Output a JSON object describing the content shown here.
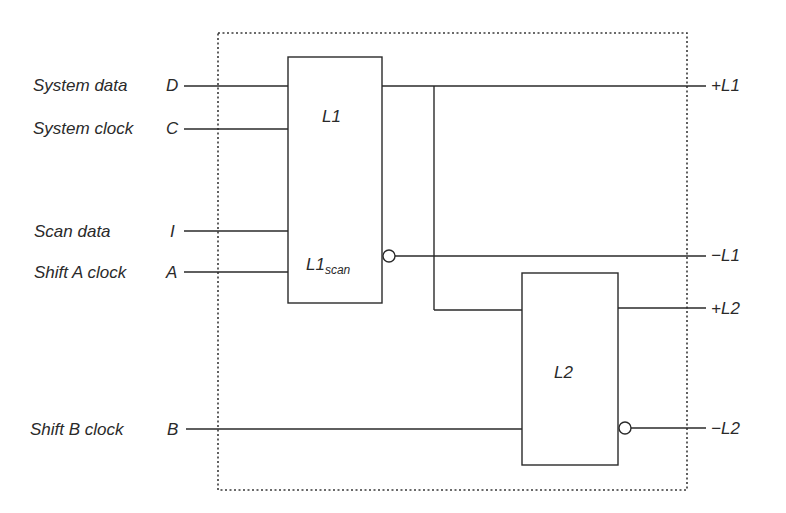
{
  "diagram": {
    "type": "LSSD shift register latch (L1/L2 scan latch)",
    "colors": {
      "line": "#2a2a2a",
      "background": "#ffffff",
      "boundary": "#3a3a3a"
    },
    "inputs": [
      {
        "label": "System data",
        "pin": "D"
      },
      {
        "label": "System clock",
        "pin": "C"
      },
      {
        "label": "Scan data",
        "pin": "I"
      },
      {
        "label": "Shift A clock",
        "pin": "A"
      },
      {
        "label": "Shift B clock",
        "pin": "B"
      }
    ],
    "blocks": {
      "l1": {
        "label": "L1",
        "scan_label": "L1",
        "scan_sub": "scan"
      },
      "l2": {
        "label": "L2"
      }
    },
    "outputs": [
      {
        "label": "+L1"
      },
      {
        "label": "−L1"
      },
      {
        "label": "+L2"
      },
      {
        "label": "−L2"
      }
    ]
  }
}
